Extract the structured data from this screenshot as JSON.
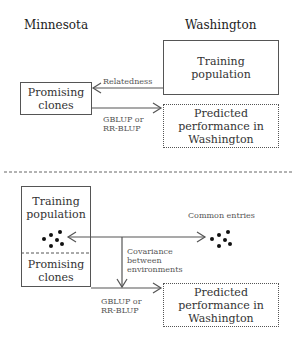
{
  "top_panel": {
    "left_heading": "Minnesota",
    "right_heading": "Washington",
    "training_box": {
      "line1": "Training",
      "line2": "population"
    },
    "promising_box": {
      "line1": "Promising",
      "line2": "clones"
    },
    "predicted_box": {
      "line1": "Predicted",
      "line2": "performance in",
      "line3": "Washington"
    },
    "arrow_relatedness_label": "Relatedness",
    "method_label": {
      "line1": "GBLUP or",
      "line2": "RR-BLUP"
    }
  },
  "bottom_panel": {
    "combined_box": {
      "training": {
        "line1": "Training",
        "line2": "population"
      },
      "promising": {
        "line1": "Promising",
        "line2": "clones"
      }
    },
    "common_entries_label": "Common entries",
    "covariance_label": {
      "line1": "Covariance",
      "line2": "between",
      "line3": "environments"
    },
    "method_label": {
      "line1": "GBLUP or",
      "line2": "RR-BLUP"
    },
    "predicted_box": {
      "line1": "Predicted",
      "line2": "performance in",
      "line3": "Washington"
    }
  },
  "colors": {
    "line": "#555555",
    "text": "#333333",
    "background": "#ffffff"
  }
}
